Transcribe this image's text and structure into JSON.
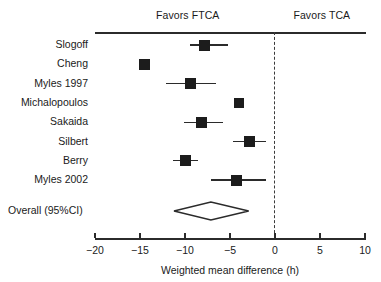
{
  "chart_data": {
    "type": "forest",
    "title": "",
    "xlabel": "Weighted mean difference (h)",
    "ylabel": "",
    "xlim": [
      -20,
      10
    ],
    "xticks": [
      -20,
      -15,
      -10,
      -5,
      0,
      5,
      10
    ],
    "xticklabels": [
      "−20",
      "−15",
      "−10",
      "−5",
      "0",
      "5",
      "10"
    ],
    "grid": false,
    "reference_line": 0,
    "reference_line_style": "dashed",
    "left_header": "Favors FTCA",
    "right_header": "Favors TCA",
    "categories": [
      "Slogoff",
      "Cheng",
      "Myles 1997",
      "Michalopoulos",
      "Sakaida",
      "Silbert",
      "Berry",
      "Myles 2002"
    ],
    "studies": [
      {
        "label": "Slogoff",
        "estimate": -7.8,
        "ci_low": -9.4,
        "ci_high": -5.2,
        "marker_size": 11
      },
      {
        "label": "Cheng",
        "estimate": -14.5,
        "ci_low": -14.9,
        "ci_high": -14.1,
        "marker_size": 11
      },
      {
        "label": "Myles 1997",
        "estimate": -9.4,
        "ci_low": -12.1,
        "ci_high": -6.5,
        "marker_size": 11
      },
      {
        "label": "Michalopoulos",
        "estimate": -4.0,
        "ci_low": -4.4,
        "ci_high": -3.6,
        "marker_size": 10
      },
      {
        "label": "Sakaida",
        "estimate": -8.2,
        "ci_low": -10.1,
        "ci_high": -5.8,
        "marker_size": 11
      },
      {
        "label": "Silbert",
        "estimate": -2.8,
        "ci_low": -4.7,
        "ci_high": -1.0,
        "marker_size": 11
      },
      {
        "label": "Berry",
        "estimate": -10.0,
        "ci_low": -11.3,
        "ci_high": -8.5,
        "marker_size": 11
      },
      {
        "label": "Myles 2002",
        "estimate": -4.3,
        "ci_low": -7.1,
        "ci_high": -1.0,
        "marker_size": 11
      }
    ],
    "overall": {
      "label": "Overall (95%CI)",
      "estimate": -7.1,
      "ci_low": -11.2,
      "ci_high": -2.9
    },
    "colors": {
      "marker": "#1c1c1c",
      "line": "#2b2b2b",
      "reference": "#3a3a3a",
      "text": "#1a1a1a",
      "background": "#ffffff"
    }
  }
}
